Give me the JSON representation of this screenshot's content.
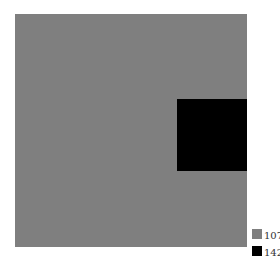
{
  "chart_data": {
    "type": "area",
    "title": "",
    "xlabel": "",
    "ylabel": "",
    "series": [
      {
        "name": "107",
        "value": 107,
        "color": "#7f7f7f"
      },
      {
        "name": "142",
        "value": 142,
        "color": "#000000"
      }
    ],
    "legend": {
      "position": "bottom-right",
      "entries": [
        "107",
        "142"
      ]
    },
    "grid": false
  }
}
